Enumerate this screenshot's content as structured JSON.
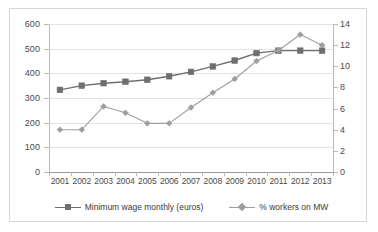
{
  "chart_data": {
    "type": "line",
    "title": "",
    "subtitle": "",
    "xlabel": "",
    "ylabel": "",
    "grid": true,
    "legend_position": "bottom",
    "categories": [
      "2001",
      "2002",
      "2003",
      "2004",
      "2005",
      "2006",
      "2007",
      "2008",
      "2009",
      "2010",
      "2011",
      "2012",
      "2013"
    ],
    "x_tick_labels": [
      "2001",
      "2002",
      "2003",
      "2004",
      "2005",
      "2006",
      "2007",
      "2008",
      "2009",
      "2010",
      "2011",
      "2012",
      "2013"
    ],
    "axes": {
      "left": {
        "label": "",
        "ylim": [
          0,
          600
        ],
        "tick_step": 100,
        "tick_labels": [
          "0",
          "100",
          "200",
          "300",
          "400",
          "500",
          "600"
        ],
        "tick_values": [
          0,
          100,
          200,
          300,
          400,
          500,
          600
        ]
      },
      "right": {
        "label": "",
        "ylim": [
          0,
          14
        ],
        "tick_step": 2,
        "tick_labels": [
          "0",
          "2",
          "4",
          "6",
          "8",
          "10",
          "12",
          "14"
        ],
        "tick_values": [
          0,
          2,
          4,
          6,
          8,
          10,
          12,
          14
        ]
      }
    },
    "series": [
      {
        "name": "Minimum wage monthly (euros)",
        "axis": "left",
        "marker": "square",
        "color": "#6f6f6f",
        "values": [
          333,
          350,
          360,
          366,
          374,
          388,
          406,
          428,
          452,
          482,
          492,
          492,
          492
        ]
      },
      {
        "name": "% workers on MW",
        "axis": "right",
        "marker": "diamond",
        "color": "#9e9e9e",
        "values": [
          4.0,
          4.0,
          6.2,
          5.6,
          4.6,
          4.6,
          6.1,
          7.5,
          8.8,
          10.5,
          11.5,
          13.0,
          12.0
        ]
      }
    ]
  },
  "legend": {
    "items": [
      {
        "label": "Minimum wage monthly (euros)",
        "marker": "square-marker",
        "color": "#6f6f6f"
      },
      {
        "label": "% workers on MW",
        "marker": "diamond-marker",
        "color": "#9e9e9e"
      }
    ]
  },
  "colors": {
    "series_1": "#6f6f6f",
    "series_2": "#9e9e9e",
    "gridline": "#e3e3e3",
    "axis": "#b9b9b9",
    "frame": "#d7d7d7",
    "background": "#ffffff",
    "text": "#4a4a4a"
  }
}
